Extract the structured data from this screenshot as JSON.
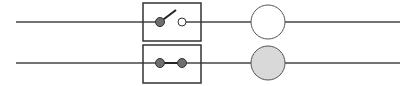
{
  "diagram": {
    "type": "circuit-switch-lamp",
    "colors": {
      "wire": "#444444",
      "box_border": "#333333",
      "contact_dot": "#6e6e6e",
      "open_contact": "#ffffff",
      "lamp_off": "#ffffff",
      "lamp_on": "#d9d9d9",
      "background": "#ffffff"
    },
    "circuits": [
      {
        "id": "circuit-1",
        "switch_state": "open",
        "lamp_state": "off",
        "wire_y": 22,
        "box": {
          "x": 143,
          "y": 3,
          "w": 58,
          "h": 38
        }
      },
      {
        "id": "circuit-2",
        "switch_state": "closed",
        "lamp_state": "on",
        "wire_y": 63,
        "box": {
          "x": 143,
          "y": 45,
          "w": 58,
          "h": 38
        }
      }
    ]
  }
}
